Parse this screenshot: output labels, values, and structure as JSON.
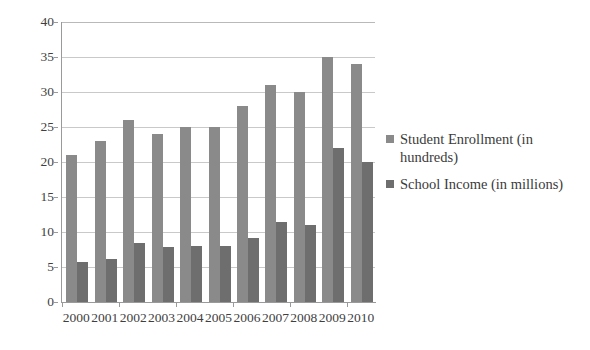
{
  "chart_data": {
    "type": "bar",
    "title": "",
    "subtitle": "",
    "xlabel": "",
    "ylabel": "",
    "categories": [
      "2000",
      "2001",
      "2002",
      "2003",
      "2004",
      "2005",
      "2006",
      "2007",
      "2008",
      "2009",
      "2010"
    ],
    "series": [
      {
        "name": "Student Enrollment (in hundreds)",
        "color": "#8a8a8a",
        "values": [
          21,
          23,
          26,
          24,
          25,
          25,
          28,
          31,
          30,
          35,
          34
        ]
      },
      {
        "name": "School Income (in millions)",
        "color": "#6e6e6e",
        "values": [
          5.7,
          6.1,
          8.4,
          7.8,
          8.0,
          8.0,
          9.2,
          11.5,
          11.0,
          22.0,
          20.0
        ]
      }
    ],
    "ylim": [
      0,
      40
    ],
    "yticks": [
      0,
      5,
      10,
      15,
      20,
      25,
      30,
      35,
      40
    ],
    "ytick_labels": [
      "0",
      "5",
      "10",
      "15",
      "20",
      "25",
      "30",
      "35",
      "40"
    ],
    "grid": "horizontal",
    "legend_position": "right",
    "background_color": "#ffffff",
    "axis_color": "#9a9a9a",
    "gridline_color": "#c9c9c9"
  }
}
